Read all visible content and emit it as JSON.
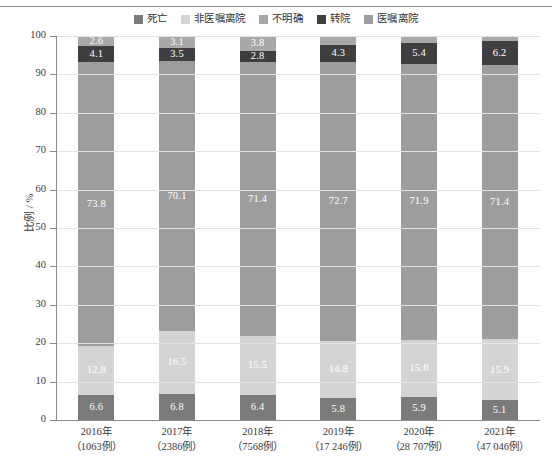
{
  "chart_data": {
    "type": "bar",
    "stacked": true,
    "orientation": "vertical",
    "title": "",
    "subtitle": "",
    "xlabel": "",
    "ylabel": "比例 / %",
    "ylim": [
      0,
      100
    ],
    "ytick_step": 10,
    "yticks": [
      100,
      90,
      80,
      70,
      60,
      50,
      40,
      30,
      20,
      10,
      0
    ],
    "grid": true,
    "legend_position": "top-center",
    "categories": [
      "2016年",
      "2017年",
      "2018年",
      "2019年",
      "2020年",
      "2021年"
    ],
    "category_sublabels": [
      "（1063例）",
      "（2386例）",
      "（7568例）",
      "（17 246例）",
      "（28 707例）",
      "（47 046例）"
    ],
    "xtick_labels": [
      {
        "line1": "2016年",
        "line2": "（1063例）"
      },
      {
        "line1": "2017年",
        "line2": "（2386例）"
      },
      {
        "line1": "2018年",
        "line2": "（7568例）"
      },
      {
        "line1": "2019年",
        "line2": "（17 246例）"
      },
      {
        "line1": "2020年",
        "line2": "（28 707例）"
      },
      {
        "line1": "2021年",
        "line2": "（47 046例）"
      }
    ],
    "stack_order_bottom_to_top": [
      "死亡",
      "非医嘱离院",
      "医嘱离院",
      "转院",
      "不明确"
    ],
    "series": [
      {
        "name": "死亡",
        "color": "#7b7b7b",
        "values": [
          6.6,
          6.8,
          6.4,
          5.8,
          5.9,
          5.1
        ]
      },
      {
        "name": "非医嘱离院",
        "color": "#d4d4d4",
        "values": [
          12.8,
          16.5,
          15.5,
          14.8,
          15.0,
          15.9
        ]
      },
      {
        "name": "医嘱离院",
        "color": "#9d9d9d",
        "values": [
          73.8,
          70.1,
          71.4,
          72.7,
          71.9,
          71.4
        ]
      },
      {
        "name": "转院",
        "color": "#3f3f3f",
        "values": [
          4.1,
          3.5,
          2.8,
          4.3,
          5.4,
          6.2
        ]
      },
      {
        "name": "不明确",
        "color": "#a8a8a8",
        "values": [
          2.6,
          3.1,
          3.8,
          2.3,
          1.7,
          1.5
        ]
      }
    ]
  },
  "legend": {
    "items": [
      {
        "label": "死亡",
        "color": "#7b7b7b"
      },
      {
        "label": "非医嘱离院",
        "color": "#d4d4d4"
      },
      {
        "label": "不明确",
        "color": "#a8a8a8"
      },
      {
        "label": "转院",
        "color": "#3f3f3f"
      },
      {
        "label": "医嘱离院",
        "color": "#9d9d9d"
      }
    ]
  },
  "axes": {
    "y_title": "比例 / %",
    "y_tick_labels": [
      "100",
      "90",
      "80",
      "70",
      "60",
      "50",
      "40",
      "30",
      "20",
      "10",
      "0"
    ]
  },
  "colors": {
    "axis": "#8c8c8c",
    "grid": "#e3e3e3",
    "text": "#3a3a3a",
    "label_text": "#ffffff",
    "background": "#ffffff"
  }
}
